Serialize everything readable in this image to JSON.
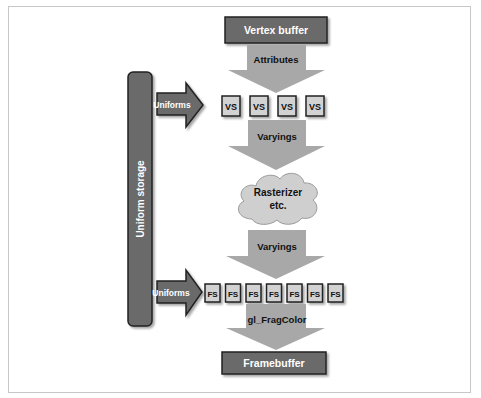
{
  "diagram": {
    "colors": {
      "dark_box": "#6b6b6b",
      "arrow_fill": "#a8a8a8",
      "shader_box": "#d2d2d2",
      "cloud": "#cfcfcf",
      "stroke": "#222222",
      "light_text": "#ffffff",
      "dark_text": "#111111"
    },
    "nodes": {
      "vertex_buffer": "Vertex buffer",
      "framebuffer": "Framebuffer",
      "uniform_storage": "Uniform storage",
      "rasterizer_line1": "Rasterizer",
      "rasterizer_line2": "etc."
    },
    "arrows": {
      "attributes": "Attributes",
      "varyings_top": "Varyings",
      "varyings_bottom": "Varyings",
      "gl_fragcolor": "gl_FragColor",
      "uniforms_vs": "Uniforms",
      "uniforms_fs": "Uniforms"
    },
    "vertex_shaders": [
      "VS",
      "VS",
      "VS",
      "VS"
    ],
    "fragment_shaders": [
      "FS",
      "FS",
      "FS",
      "FS",
      "FS",
      "FS",
      "FS"
    ]
  }
}
